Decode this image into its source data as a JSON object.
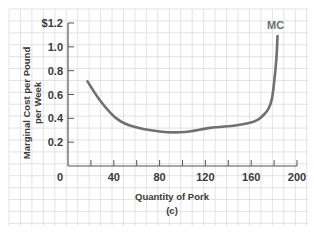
{
  "chart_data": {
    "type": "line",
    "title": "",
    "subtitle": "(c)",
    "xlabel": "Quantity of Pork",
    "ylabel": [
      "Marginal Cost per Pound",
      "per Week"
    ],
    "xlim": [
      0,
      200
    ],
    "ylim": [
      0,
      1.2
    ],
    "x_ticks": [
      20,
      40,
      60,
      80,
      100,
      120,
      140,
      160,
      180,
      200
    ],
    "x_tick_labels": [
      {
        "value": 0,
        "label": "0"
      },
      {
        "value": 40,
        "label": "40"
      },
      {
        "value": 80,
        "label": "80"
      },
      {
        "value": 120,
        "label": "120"
      },
      {
        "value": 160,
        "label": "160"
      },
      {
        "value": 200,
        "label": "200"
      }
    ],
    "y_tick_labels": [
      {
        "value": 0.2,
        "label": "0.2"
      },
      {
        "value": 0.4,
        "label": "0.4"
      },
      {
        "value": 0.6,
        "label": "0.6"
      },
      {
        "value": 0.8,
        "label": "0.8"
      },
      {
        "value": 1.0,
        "label": "1.0"
      },
      {
        "value": 1.2,
        "label": "$1.2"
      }
    ],
    "grid": true,
    "series": [
      {
        "name": "MC",
        "color": "#707070",
        "points": [
          [
            17,
            0.71
          ],
          [
            28,
            0.55
          ],
          [
            41,
            0.41
          ],
          [
            54,
            0.34
          ],
          [
            80,
            0.29
          ],
          [
            102,
            0.285
          ],
          [
            124,
            0.32
          ],
          [
            146,
            0.34
          ],
          [
            158,
            0.36
          ],
          [
            166,
            0.39
          ],
          [
            171,
            0.43
          ],
          [
            175,
            0.48
          ],
          [
            178,
            0.56
          ],
          [
            180,
            0.7
          ],
          [
            182,
            0.9
          ],
          [
            183,
            1.09
          ]
        ]
      }
    ]
  }
}
